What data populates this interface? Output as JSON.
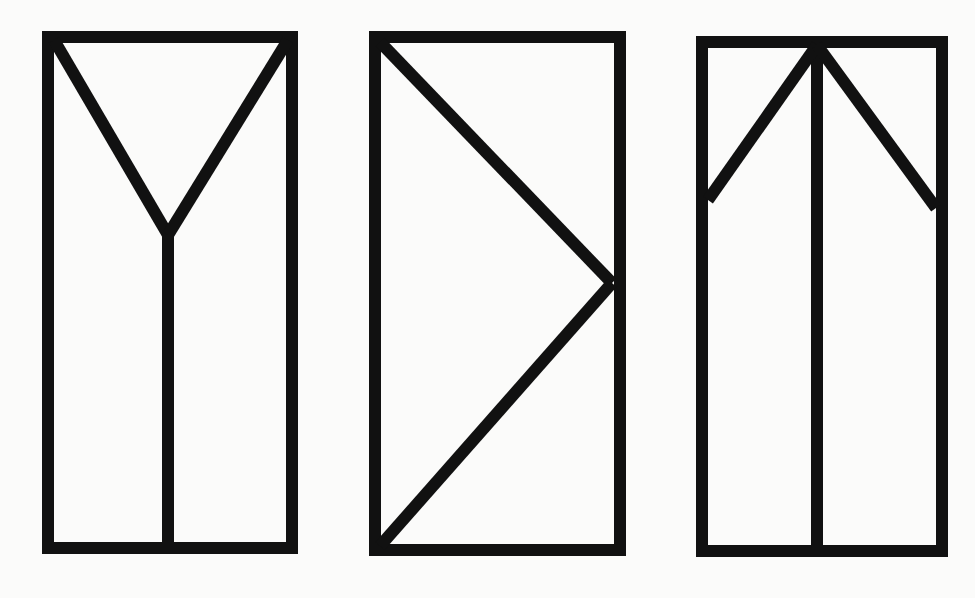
{
  "background": "#fbfbfa",
  "stroke_color": "#111111",
  "stroke_width": 12,
  "figures": [
    {
      "name": "figure-y-in-rectangle",
      "rect": {
        "x": 48,
        "y": 37,
        "width": 244,
        "height": 511
      },
      "lines": [
        {
          "x1": 54,
          "y1": 40,
          "x2": 168,
          "y2": 235
        },
        {
          "x1": 288,
          "y1": 40,
          "x2": 168,
          "y2": 235
        },
        {
          "x1": 168,
          "y1": 235,
          "x2": 168,
          "y2": 548
        }
      ]
    },
    {
      "name": "figure-chevron-in-rectangle",
      "rect": {
        "x": 375,
        "y": 37,
        "width": 245,
        "height": 513
      },
      "lines": [
        {
          "x1": 380,
          "y1": 42,
          "x2": 612,
          "y2": 283
        },
        {
          "x1": 612,
          "y1": 283,
          "x2": 380,
          "y2": 546
        }
      ]
    },
    {
      "name": "figure-arrow-in-rectangle",
      "rect": {
        "x": 702,
        "y": 42,
        "width": 240,
        "height": 509
      },
      "lines": [
        {
          "x1": 817,
          "y1": 42,
          "x2": 817,
          "y2": 551
        },
        {
          "x1": 817,
          "y1": 45,
          "x2": 708,
          "y2": 200
        },
        {
          "x1": 817,
          "y1": 45,
          "x2": 936,
          "y2": 208
        }
      ]
    }
  ]
}
